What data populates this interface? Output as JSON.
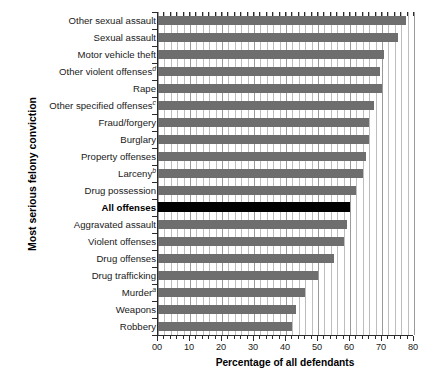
{
  "chart_data": {
    "type": "bar",
    "orientation": "horizontal",
    "title": "",
    "xlabel": "Percentage of all defendants",
    "ylabel": "Most serious felony conviction",
    "xlim": [
      0,
      80
    ],
    "xticks": [
      "00",
      "10",
      "20",
      "30",
      "40",
      "50",
      "60",
      "70",
      "80"
    ],
    "xtick_values": [
      0,
      10,
      20,
      30,
      40,
      50,
      60,
      70,
      80
    ],
    "minor_tick_step": 2,
    "grid": "vertical",
    "legend": "none",
    "categories": [
      "Other sexual assault",
      "Sexual assault",
      "Motor vehicle theft",
      "Other violent offenses",
      "Rape",
      "Other specified offenses",
      "Fraud/forgery",
      "Burglary",
      "Property offenses",
      "Larceny",
      "Drug possession",
      "All offenses",
      "Aggravated assault",
      "Violent offenses",
      "Drug offenses",
      "Drug trafficking",
      "Murder",
      "Weapons",
      "Robbery"
    ],
    "category_footnotes": [
      "",
      "",
      "",
      "d",
      "",
      "c",
      "",
      "",
      "",
      "b",
      "",
      "",
      "",
      "",
      "",
      "",
      "a",
      "",
      ""
    ],
    "values": [
      77.5,
      75,
      70.5,
      69.5,
      70,
      67.5,
      66,
      66,
      65,
      64,
      62,
      60,
      59,
      58,
      55,
      50,
      46,
      43,
      42
    ],
    "highlight_index": 11,
    "colors": {
      "bar": "#6e6e6e",
      "highlight_bar": "#000000",
      "gridline": "#bdbdbd",
      "axis": "#2b2b2b",
      "background": "#ffffff",
      "text": "#1a1a1a"
    }
  }
}
